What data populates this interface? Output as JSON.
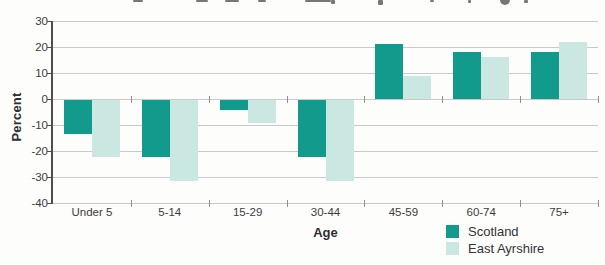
{
  "chart_data": {
    "type": "bar",
    "title": "",
    "categories": [
      "Under 5",
      "5-14",
      "15-29",
      "30-44",
      "45-59",
      "60-74",
      "75+"
    ],
    "series": [
      {
        "name": "Scotland",
        "color": "#129a8c",
        "values": [
          -13,
          -22,
          -4,
          -22,
          21,
          18,
          18
        ]
      },
      {
        "name": "East Ayrshire",
        "color": "#cbe7e2",
        "values": [
          -22,
          -31,
          -9,
          -31,
          9,
          16,
          22
        ]
      }
    ],
    "xlabel": "Age",
    "ylabel": "Percent",
    "ylim": [
      -40,
      30
    ],
    "ytick_step": 10,
    "yticks": [
      30,
      20,
      10,
      0,
      -10,
      -20,
      -30,
      -40
    ],
    "grid": true,
    "legend_position": "bottom-right",
    "colors": {
      "gridline": "#c9c9c9",
      "axis": "#4d4d4d",
      "text": "#3c3c3c",
      "background": "#fdfdfc"
    }
  }
}
